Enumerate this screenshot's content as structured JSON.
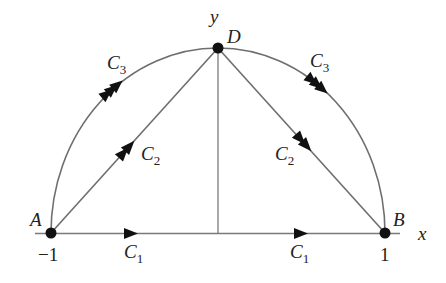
{
  "diagram": {
    "type": "contour-paths",
    "axes": {
      "x_label": "x",
      "y_label": "y",
      "ticks": {
        "left": "−1",
        "right": "1"
      }
    },
    "points": {
      "A": {
        "label": "A",
        "coord": "(-1, 0)"
      },
      "B": {
        "label": "B",
        "coord": "(1, 0)"
      },
      "D": {
        "label": "D",
        "coord": "(0, 1)"
      }
    },
    "curves": [
      {
        "id": "C1",
        "label": "C",
        "sub": "1",
        "description": "straight segment from A to B along x-axis",
        "arrowheads": 1
      },
      {
        "id": "C2",
        "label": "C",
        "sub": "2",
        "description": "straight segments A to D and D to B",
        "arrowheads": 2
      },
      {
        "id": "C3",
        "label": "C",
        "sub": "3",
        "description": "semicircular arc from A through D to B",
        "arrowheads": 3
      }
    ],
    "colors": {
      "line": "#6e6e6e",
      "arrow": "#111111",
      "point": "#111111",
      "text": "#222222"
    }
  }
}
